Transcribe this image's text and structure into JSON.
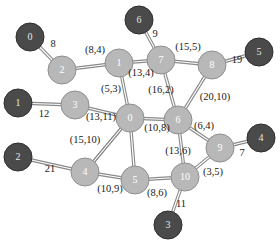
{
  "diagram": {
    "type": "network-graph",
    "width": 280,
    "height": 245,
    "background_color": "#ffffff",
    "palette": {
      "node_dark_fill": "#4a4a4a",
      "node_dark_stroke": "#2e2e2e",
      "node_light_fill": "#b8b8b8",
      "node_light_stroke": "#8f8f8f",
      "edge_color": "#8a8a8a",
      "label_color": "#1a1a1a",
      "node_text_color": "#ffffff"
    },
    "nodes": [
      {
        "id": "n-terminal-0",
        "label": "0",
        "x": 30,
        "y": 37,
        "r": 14,
        "style": "dark"
      },
      {
        "id": "n-hub-2",
        "label": "2",
        "x": 62,
        "y": 70,
        "r": 14,
        "style": "light"
      },
      {
        "id": "n-hub-1",
        "label": "1",
        "x": 119,
        "y": 63,
        "r": 14,
        "style": "light"
      },
      {
        "id": "n-terminal-6",
        "label": "6",
        "x": 139,
        "y": 20,
        "r": 14,
        "style": "dark"
      },
      {
        "id": "n-hub-7",
        "label": "7",
        "x": 161,
        "y": 60,
        "r": 14,
        "style": "light"
      },
      {
        "id": "n-hub-8",
        "label": "8",
        "x": 212,
        "y": 65,
        "r": 14,
        "style": "light"
      },
      {
        "id": "n-terminal-5",
        "label": "5",
        "x": 259,
        "y": 52,
        "r": 14,
        "style": "dark"
      },
      {
        "id": "n-terminal-1",
        "label": "1",
        "x": 18,
        "y": 103,
        "r": 14,
        "style": "dark"
      },
      {
        "id": "n-hub-3",
        "label": "3",
        "x": 75,
        "y": 105,
        "r": 14,
        "style": "light"
      },
      {
        "id": "n-hub-0",
        "label": "0",
        "x": 130,
        "y": 118,
        "r": 14,
        "style": "light"
      },
      {
        "id": "n-hub-6",
        "label": "6",
        "x": 178,
        "y": 120,
        "r": 14,
        "style": "light"
      },
      {
        "id": "n-hub-9",
        "label": "9",
        "x": 220,
        "y": 148,
        "r": 14,
        "style": "light"
      },
      {
        "id": "n-terminal-4",
        "label": "4",
        "x": 261,
        "y": 138,
        "r": 14,
        "style": "dark"
      },
      {
        "id": "n-terminal-2",
        "label": "2",
        "x": 18,
        "y": 157,
        "r": 14,
        "style": "dark"
      },
      {
        "id": "n-hub-4",
        "label": "4",
        "x": 85,
        "y": 172,
        "r": 14,
        "style": "light"
      },
      {
        "id": "n-hub-5",
        "label": "5",
        "x": 135,
        "y": 180,
        "r": 14,
        "style": "light"
      },
      {
        "id": "n-hub-10",
        "label": "10",
        "x": 185,
        "y": 177,
        "r": 14,
        "style": "light"
      },
      {
        "id": "n-terminal-3",
        "label": "3",
        "x": 168,
        "y": 225,
        "r": 14,
        "style": "dark"
      }
    ],
    "edges": [
      {
        "id": "e-t0-h2",
        "from": "n-terminal-0",
        "to": "n-hub-2",
        "label": "8",
        "lx": 53,
        "ly": 45
      },
      {
        "id": "e-h2-h1",
        "from": "n-hub-2",
        "to": "n-hub-1",
        "label": "(8,4)",
        "lx": 95,
        "ly": 51
      },
      {
        "id": "e-t6-h7",
        "from": "n-terminal-6",
        "to": "n-hub-7",
        "label": "9",
        "lx": 155,
        "ly": 35
      },
      {
        "id": "e-h1-h7",
        "from": "n-hub-1",
        "to": "n-hub-7",
        "label": "(13,4)",
        "lx": 141,
        "ly": 74
      },
      {
        "id": "e-h7-h8",
        "from": "n-hub-7",
        "to": "n-hub-8",
        "label": "(15,5)",
        "lx": 188,
        "ly": 48
      },
      {
        "id": "e-h8-t5",
        "from": "n-hub-8",
        "to": "n-terminal-5",
        "label": "19",
        "lx": 237,
        "ly": 61
      },
      {
        "id": "e-h1-h0",
        "from": "n-hub-1",
        "to": "n-hub-0",
        "label": "(5,3)",
        "lx": 111,
        "ly": 90
      },
      {
        "id": "e-h7-h6",
        "from": "n-hub-7",
        "to": "n-hub-6",
        "label": "(16,2)",
        "lx": 161,
        "ly": 91
      },
      {
        "id": "e-h8-h6",
        "from": "n-hub-8",
        "to": "n-hub-6",
        "label": "(20,10)",
        "lx": 215,
        "ly": 98
      },
      {
        "id": "e-t1-h3",
        "from": "n-terminal-1",
        "to": "n-hub-3",
        "label": "12",
        "lx": 44,
        "ly": 115
      },
      {
        "id": "e-h3-h0",
        "from": "n-hub-3",
        "to": "n-hub-0",
        "label": "(13,11)",
        "lx": 101,
        "ly": 118
      },
      {
        "id": "e-h0-h6",
        "from": "n-hub-0",
        "to": "n-hub-6",
        "label": "(10,8)",
        "lx": 157,
        "ly": 129
      },
      {
        "id": "e-h6-h9",
        "from": "n-hub-6",
        "to": "n-hub-9",
        "label": "(6,4)",
        "lx": 204,
        "ly": 127
      },
      {
        "id": "e-h9-t4",
        "from": "n-hub-9",
        "to": "n-terminal-4",
        "label": "7",
        "lx": 242,
        "ly": 154
      },
      {
        "id": "e-h0-h4",
        "from": "n-hub-0",
        "to": "n-hub-4",
        "label": "(15,10)",
        "lx": 85,
        "ly": 141
      },
      {
        "id": "e-t2-h4",
        "from": "n-terminal-2",
        "to": "n-hub-4",
        "label": "21",
        "lx": 50,
        "ly": 170
      },
      {
        "id": "e-h4-h5",
        "from": "n-hub-4",
        "to": "n-hub-5",
        "label": "(10,9)",
        "lx": 110,
        "ly": 190
      },
      {
        "id": "e-h6-h10",
        "from": "n-hub-6",
        "to": "n-hub-10",
        "label": "(13,6)",
        "lx": 178,
        "ly": 152
      },
      {
        "id": "e-h5-h10",
        "from": "n-hub-5",
        "to": "n-hub-10",
        "label": "(8,6)",
        "lx": 157,
        "ly": 194
      },
      {
        "id": "e-h10-h9",
        "from": "n-hub-10",
        "to": "n-hub-9",
        "label": "(3,5)",
        "lx": 213,
        "ly": 173
      },
      {
        "id": "e-h10-t3",
        "from": "n-hub-10",
        "to": "n-terminal-3",
        "label": "11",
        "lx": 181,
        "ly": 205
      },
      {
        "id": "e-h0-h5",
        "from": "n-hub-0",
        "to": "n-hub-5",
        "label": "",
        "lx": 0,
        "ly": 0
      },
      {
        "id": "e-h4-h0b",
        "from": "n-hub-4",
        "to": "n-hub-0",
        "label": "",
        "lx": 0,
        "ly": 0
      }
    ]
  }
}
